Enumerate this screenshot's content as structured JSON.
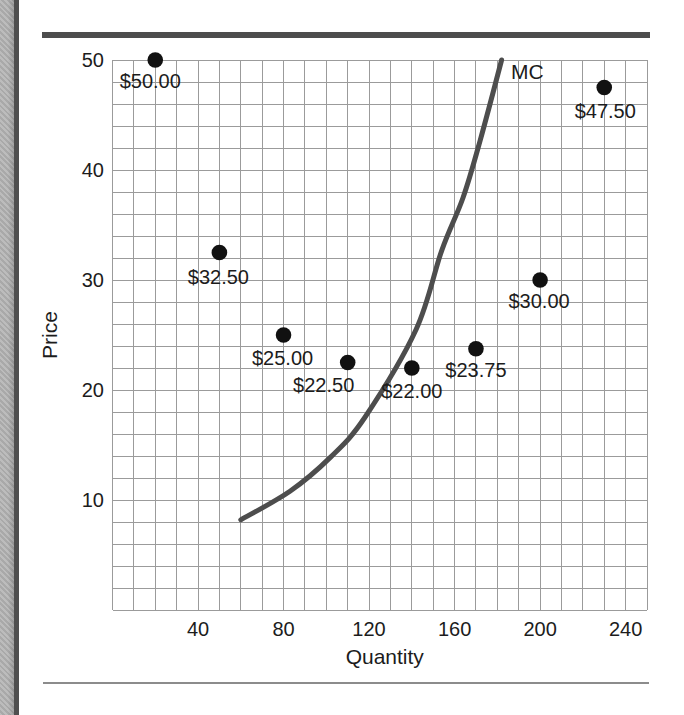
{
  "frame": {
    "background": "#ffffff",
    "left_bar_color": "#b0b0b0",
    "left_rule_color": "#4f4f4f",
    "top_rule_color": "#4d4d4d",
    "bottom_rule_color": "#8c8c8c"
  },
  "chart_data": {
    "type": "scatter",
    "title": "",
    "xlabel": "Quantity",
    "ylabel": "Price",
    "xlim": [
      0,
      250
    ],
    "ylim": [
      0,
      50
    ],
    "x_ticks": [
      40,
      80,
      120,
      160,
      200,
      240
    ],
    "y_ticks": [
      10,
      20,
      30,
      40,
      50
    ],
    "grid": {
      "on": true,
      "x_step": 10,
      "y_step": 2,
      "color": "#9b9b9b"
    },
    "text_color": "#1c1c1c",
    "point_color": "#111111",
    "points": [
      {
        "quantity": 20,
        "price": 50,
        "label": "$50.00",
        "label_offset": [
          -5,
          21
        ]
      },
      {
        "quantity": 50,
        "price": 32.5,
        "label": "$32.50",
        "label_offset": [
          -1,
          24
        ]
      },
      {
        "quantity": 80,
        "price": 25,
        "label": "$25.00",
        "label_offset": [
          -1,
          23
        ]
      },
      {
        "quantity": 110,
        "price": 22.5,
        "label": "$22.50",
        "label_offset": [
          -24,
          22
        ]
      },
      {
        "quantity": 140,
        "price": 22,
        "label": "$22.00",
        "label_offset": [
          0,
          23
        ]
      },
      {
        "quantity": 170,
        "price": 23.75,
        "label": "$23.75",
        "label_offset": [
          0,
          21
        ]
      },
      {
        "quantity": 200,
        "price": 30,
        "label": "$30.00",
        "label_offset": [
          -1,
          21
        ]
      },
      {
        "quantity": 230,
        "price": 47.5,
        "label": "$47.50",
        "label_offset": [
          1,
          23
        ]
      }
    ],
    "curve": {
      "name": "MC",
      "color": "#4d4d4d",
      "points": [
        [
          60,
          8.2
        ],
        [
          83,
          10.8
        ],
        [
          102,
          13.9
        ],
        [
          118,
          17.5
        ],
        [
          142,
          25.5
        ],
        [
          154,
          32.7
        ],
        [
          164,
          37.5
        ],
        [
          172,
          42.7
        ],
        [
          182,
          50
        ]
      ],
      "label_at": [
        194,
        48.3
      ]
    }
  }
}
